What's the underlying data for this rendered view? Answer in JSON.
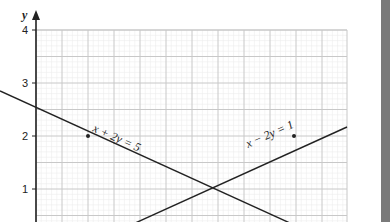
{
  "chart_data": {
    "type": "line",
    "title": "",
    "xlabel": "",
    "ylabel": "y",
    "xlim": [
      0,
      6
    ],
    "ylim": [
      0,
      4
    ],
    "yticks": [
      "1",
      "2",
      "3",
      "4"
    ],
    "grid": true,
    "series": [
      {
        "name": "x + 2y = 5",
        "equation": "x + 2y = 5",
        "points": [
          [
            -0.7,
            2.85
          ],
          [
            6,
            -0.5
          ]
        ],
        "marked_point": [
          1,
          2
        ]
      },
      {
        "name": "x − 2y = 1",
        "equation": "x − 2y = 1",
        "points": [
          [
            0,
            -0.5
          ],
          [
            6,
            2.5
          ]
        ],
        "marked_point": [
          5,
          2
        ]
      }
    ],
    "intersection": [
      3,
      1
    ]
  },
  "labels": {
    "y_axis": "y",
    "line1": "x + 2y = 5",
    "line2": "x − 2y = 1",
    "tick_4": "4",
    "tick_3": "3",
    "tick_2": "2",
    "tick_1": "1"
  },
  "colors": {
    "line": "#222222",
    "major_grid": "#c8c8c8",
    "minor_grid": "#ececec",
    "side_bar": "#7a7a7a"
  }
}
